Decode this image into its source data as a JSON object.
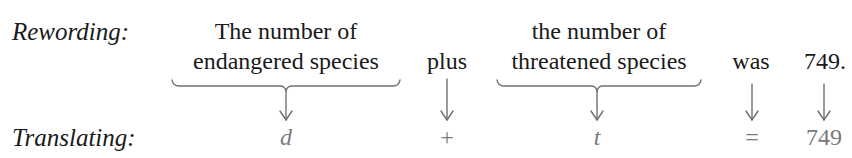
{
  "rewording": {
    "label": "Rewording:",
    "phrases": [
      {
        "line1": "The number of",
        "line2": "endangered species",
        "braced": true
      },
      {
        "line1": "",
        "line2": "plus",
        "braced": false
      },
      {
        "line1": "the number of",
        "line2": "threatened species",
        "braced": true
      },
      {
        "line1": "",
        "line2": "was",
        "braced": false
      },
      {
        "line1": "",
        "line2": "749.",
        "braced": false
      }
    ]
  },
  "translating": {
    "label": "Translating:",
    "symbols": [
      "d",
      "+",
      "t",
      "=",
      "749"
    ]
  },
  "colors": {
    "text": "#1a1a1a",
    "math": "#7a7a7a",
    "arrows": "#707070"
  }
}
